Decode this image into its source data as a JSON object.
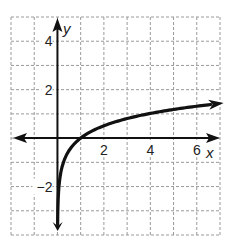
{
  "chart_data": {
    "type": "line",
    "title": "",
    "xlabel": "x",
    "ylabel": "y",
    "xlim": [
      -2,
      7
    ],
    "ylim": [
      -4,
      5
    ],
    "grid": true,
    "grid_style": "dashed",
    "x_ticks": [
      2,
      4,
      6
    ],
    "x_tick_labels": [
      "2",
      "4",
      "6"
    ],
    "y_ticks": [
      4,
      2,
      -2
    ],
    "y_tick_labels": [
      "4",
      "2",
      "−2"
    ],
    "series": [
      {
        "name": "logarithmic curve",
        "description": "y = log_b(x), increasing, vertical asymptote at x = 0, x-intercept (1, 0)",
        "x": [
          0.03,
          0.06,
          0.1,
          0.25,
          0.5,
          1,
          2,
          3,
          4,
          5,
          6,
          6.8
        ],
        "y": [
          -2.6,
          -2.1,
          -1.8,
          -1.05,
          -0.55,
          0,
          0.55,
          0.85,
          1.05,
          1.2,
          1.35,
          1.45
        ],
        "x_intercept": [
          1,
          0
        ],
        "asymptote": "x = 0",
        "arrows": [
          "bottom end near y = -3.8",
          "right end near x = 6.8"
        ]
      }
    ],
    "colors": {
      "curve": "#111111",
      "axes": "#111111",
      "grid": "#9a9a9a"
    }
  }
}
